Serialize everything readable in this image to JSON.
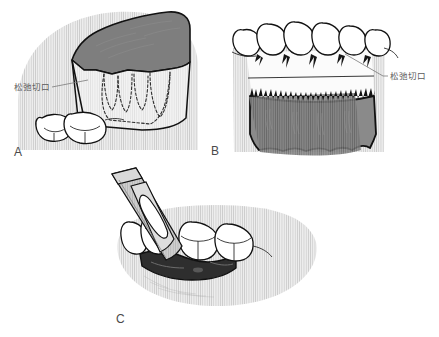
{
  "figure": {
    "title": "",
    "kind": "medical-illustration",
    "background_color": "#ffffff",
    "ink_color": "#111111"
  },
  "palette": {
    "paper": "#ffffff",
    "tissue_light": "#e6e6e6",
    "tissue_mid": "#c9c9c9",
    "flap_dark": "#7d7d7d",
    "flap_darker": "#6e6e6e",
    "flap_inner": "#f0f0f0",
    "instrument": "#c4c4c4",
    "instrument_light": "#dcdcdc",
    "exposed_bone": "#3a3a3a",
    "hatch_line": "#b4b4b4",
    "outline": "#111111",
    "label_text": "#5b5b5b",
    "letter_text": "#4a4a4a"
  },
  "panels": [
    {
      "id": "A",
      "letter": "A",
      "caption": "",
      "view": "buccal oblique view of reflected flap over molars",
      "callout": {
        "text": "松弛切口",
        "target": "vertical releasing incision",
        "leader_from_x": 52,
        "leader_from_y": 88,
        "leader_to_x": 88,
        "leader_to_y": 80
      },
      "teeth_count": 2,
      "roots_outlined_dashed": 3
    },
    {
      "id": "B",
      "letter": "B",
      "caption": "",
      "view": "frontal view of anterior teeth with full thickness flap reflected",
      "callout": {
        "text": "松弛切口",
        "target": "horizontal incision line",
        "leader_from_x": 382,
        "leader_from_y": 78,
        "leader_to_x": 345,
        "leader_to_y": 55
      },
      "teeth_count": 6,
      "papillae_count": 5
    },
    {
      "id": "C",
      "letter": "C",
      "caption": "",
      "view": "periosteal elevator raising flap between premolar and molar",
      "callout": null,
      "teeth_count": 5,
      "instrument": "periosteal-elevator"
    }
  ],
  "labels": {
    "relaxing_incision": "松弛切口",
    "panel_a": "A",
    "panel_b": "B",
    "panel_c": "C"
  }
}
